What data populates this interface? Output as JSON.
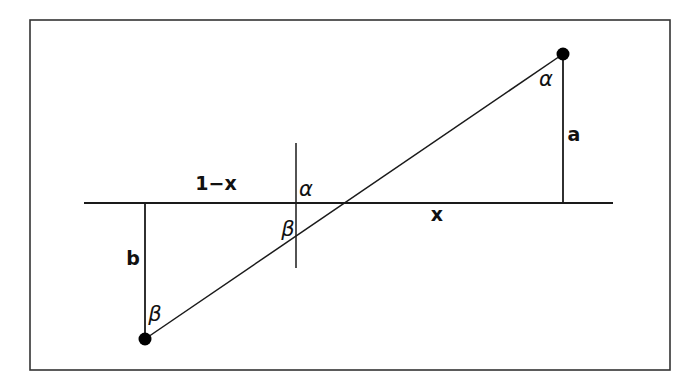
{
  "figure": {
    "background_color": "#ffffff",
    "stroke_color": "#1a1a1a",
    "border": {
      "name": "figure-border",
      "x": 30,
      "y": 20,
      "width": 640,
      "height": 350,
      "stroke_width": 1.6,
      "color": "#333333"
    },
    "lines": {
      "horizontal_axis": {
        "label": "horizontal-axis",
        "x1": 84,
        "y1": 203,
        "x2": 613,
        "y2": 203,
        "stroke_width": 2.2
      },
      "slanted_ray": {
        "label": "slanted-ray",
        "x1": 145,
        "y1": 339,
        "x2": 563,
        "y2": 54,
        "stroke_width": 1.5
      },
      "vertical_tick_center": {
        "label": "center-vertical-tick",
        "x1": 296,
        "y1": 143,
        "x2": 296,
        "y2": 268,
        "stroke_width": 1.5
      },
      "vertical_a": {
        "label": "segment-a",
        "x1": 563,
        "y1": 54,
        "x2": 563,
        "y2": 203,
        "stroke_width": 1.8
      },
      "vertical_b": {
        "label": "segment-b",
        "x1": 145,
        "y1": 203,
        "x2": 145,
        "y2": 339,
        "stroke_width": 1.8
      }
    },
    "points": [
      {
        "name": "upper-endpoint-dot",
        "cx": 563,
        "cy": 54,
        "r": 6.5,
        "fill": "#000000"
      },
      {
        "name": "lower-endpoint-dot",
        "cx": 145,
        "cy": 339,
        "r": 6.5,
        "fill": "#000000"
      }
    ],
    "labels": {
      "one_minus_x": {
        "text": "1−x",
        "x": 216,
        "y": 190,
        "anchor": "middle"
      },
      "x": {
        "text": "x",
        "x": 437,
        "y": 221,
        "anchor": "middle"
      },
      "a": {
        "text": "a",
        "x": 574,
        "y": 141,
        "anchor": "middle"
      },
      "b": {
        "text": "b",
        "x": 133,
        "y": 265,
        "anchor": "middle"
      },
      "alpha_top": {
        "text": "α",
        "x": 546,
        "y": 86,
        "anchor": "middle"
      },
      "alpha_center": {
        "text": "α",
        "x": 306,
        "y": 196,
        "anchor": "middle"
      },
      "beta_center": {
        "text": "β",
        "x": 288,
        "y": 236,
        "anchor": "middle"
      },
      "beta_bottom": {
        "text": "β",
        "x": 155,
        "y": 321,
        "anchor": "middle"
      }
    }
  }
}
